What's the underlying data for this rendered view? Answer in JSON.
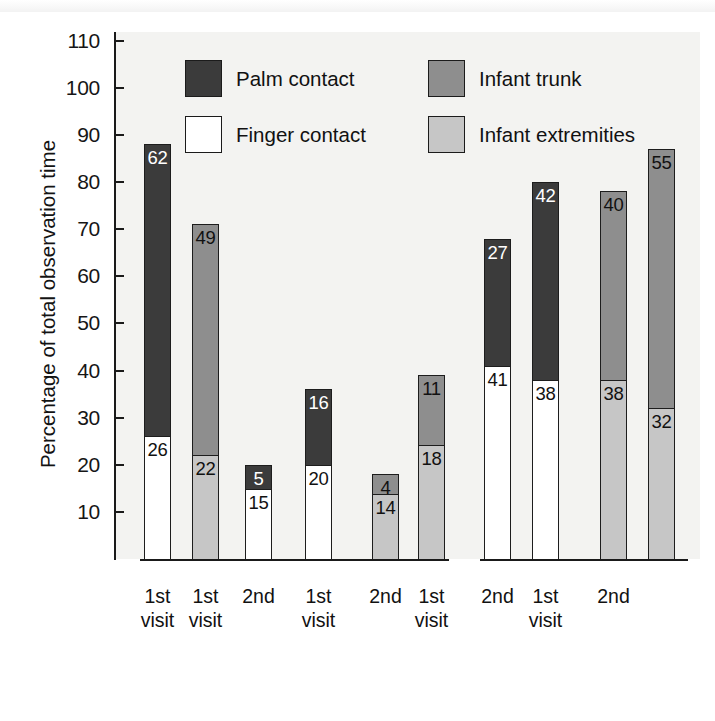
{
  "chart_data": {
    "type": "bar",
    "title": "",
    "subtitle": "",
    "xlabel": "",
    "ylabel": "Percentage of total observation time",
    "ylim": [
      0,
      110
    ],
    "yticks": [
      110,
      100,
      90,
      80,
      70,
      60,
      50,
      40,
      30,
      20,
      10
    ],
    "grid": false,
    "stacked": true,
    "legend_position": "inside-top-center",
    "legend": [
      {
        "name": "Palm contact",
        "color": "#3b3b3b"
      },
      {
        "name": "Finger contact",
        "color": "#ffffff"
      },
      {
        "name": "Infant trunk",
        "color": "#8e8e8e"
      },
      {
        "name": "Infant extremities",
        "color": "#c6c6c6"
      }
    ],
    "groups": [
      {
        "label": "Full term",
        "bars": [
          {
            "visit": "1st\nvisit",
            "visit_line1": "1st",
            "visit_line2": "visit",
            "total": 88,
            "segments": [
              {
                "series": "Finger contact",
                "value": 26,
                "label": "26"
              },
              {
                "series": "Palm contact",
                "value": 62,
                "label": "62"
              }
            ]
          },
          {
            "visit": "",
            "visit_line1": "",
            "visit_line2": "",
            "total": 71,
            "segments": [
              {
                "series": "Infant extremities",
                "value": 22,
                "label": "22"
              },
              {
                "series": "Infant trunk",
                "value": 49,
                "label": "49"
              }
            ]
          }
        ]
      },
      {
        "label": "Mother visits the\npremature\nin the incubator",
        "label_line1": "Mother visits the",
        "label_line2": "premature",
        "label_line3": "in the incubator",
        "bars": [
          {
            "visit_line1": "1st",
            "visit_line2": "visit",
            "total": 20,
            "segments": [
              {
                "series": "Finger contact",
                "value": 15,
                "label": "15"
              },
              {
                "series": "Palm contact",
                "value": 5,
                "label": "5"
              }
            ]
          },
          {
            "visit_line1": "2nd",
            "visit_line2": "",
            "total": 36,
            "segments": [
              {
                "series": "Finger contact",
                "value": 20,
                "label": "20"
              },
              {
                "series": "Palm contact",
                "value": 16,
                "label": "16"
              }
            ]
          },
          {
            "visit_line1": "1st",
            "visit_line2": "visit",
            "total": 18,
            "segments": [
              {
                "series": "Infant extremities",
                "value": 14,
                "label": "14"
              },
              {
                "series": "Infant trunk",
                "value": 4,
                "label": "4"
              }
            ]
          },
          {
            "visit_line1": "2nd",
            "visit_line2": "",
            "total": 39,
            "segments": [
              {
                "series": "Infant extremities",
                "value": 18,
                "label": "18"
              },
              {
                "series": "Infant trunk",
                "value": 11,
                "label": "11"
              }
            ]
          }
        ]
      },
      {
        "label": "Premature visits the\nmother in her room",
        "label_line1": "Premature visits the",
        "label_line2": "mother in her room",
        "bars": [
          {
            "visit_line1": "1st",
            "visit_line2": "visit",
            "total": 68,
            "segments": [
              {
                "series": "Finger contact",
                "value": 41,
                "label": "41"
              },
              {
                "series": "Palm contact",
                "value": 27,
                "label": "27"
              }
            ]
          },
          {
            "visit_line1": "2nd",
            "visit_line2": "",
            "total": 80,
            "segments": [
              {
                "series": "Finger contact",
                "value": 38,
                "label": "38"
              },
              {
                "series": "Palm contact",
                "value": 42,
                "label": "42"
              }
            ]
          },
          {
            "visit_line1": "1st",
            "visit_line2": "visit",
            "total": 78,
            "segments": [
              {
                "series": "Infant extremities",
                "value": 38,
                "label": "38"
              },
              {
                "series": "Infant trunk",
                "value": 40,
                "label": "40"
              }
            ]
          },
          {
            "visit_line1": "2nd",
            "visit_line2": "",
            "total": 87,
            "segments": [
              {
                "series": "Infant extremities",
                "value": 32,
                "label": "32"
              },
              {
                "series": "Infant trunk",
                "value": 55,
                "label": "55"
              }
            ]
          }
        ]
      }
    ]
  },
  "axis": {
    "y_title": "Percentage of total observation time",
    "y_ticks": [
      "110",
      "100",
      "90",
      "80",
      "70",
      "60",
      "50",
      "40",
      "30",
      "20",
      "10"
    ]
  },
  "legend": {
    "items": [
      {
        "label": "Palm contact",
        "swatch": "dark"
      },
      {
        "label": "Infant trunk",
        "swatch": "mid"
      },
      {
        "label": "Finger contact",
        "swatch": "white"
      },
      {
        "label": "Infant extremities",
        "swatch": "light"
      }
    ]
  },
  "x_axis": {
    "visits": [
      {
        "line1": "1st",
        "line2": "visit"
      },
      {
        "line1": "1st",
        "line2": "visit"
      },
      {
        "line1": "2nd",
        "line2": ""
      },
      {
        "line1": "1st",
        "line2": "visit"
      },
      {
        "line1": "2nd",
        "line2": ""
      },
      {
        "line1": "1st",
        "line2": "visit"
      },
      {
        "line1": "2nd",
        "line2": ""
      },
      {
        "line1": "1st",
        "line2": "visit"
      },
      {
        "line1": "2nd",
        "line2": ""
      }
    ],
    "groups": [
      {
        "line1": "Full term",
        "line2": "",
        "line3": ""
      },
      {
        "line1": "Mother visits the",
        "line2": "premature",
        "line3": "in the incubator"
      },
      {
        "line1": "Premature visits the",
        "line2": "mother in her room",
        "line3": ""
      }
    ]
  },
  "colors": {
    "palm": "#3b3b3b",
    "finger": "#ffffff",
    "trunk": "#8e8e8e",
    "extremities": "#c6c6c6",
    "plot_bg": "#f3f3f1",
    "ink": "#1a1a1a"
  },
  "footer": {
    "partial_caption": ""
  }
}
